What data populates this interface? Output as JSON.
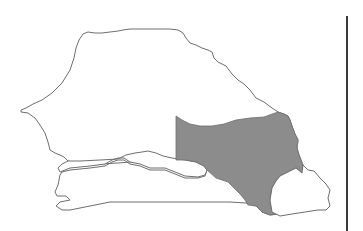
{
  "map": {
    "country": "Senegal",
    "highlighted_region": "Tambacounda",
    "colors": {
      "outline": "#6e6e6e",
      "land_fill": "#ffffff",
      "highlight_fill": "#8c8c8c",
      "divider": "#3a3a3a",
      "background": "#ffffff"
    }
  }
}
